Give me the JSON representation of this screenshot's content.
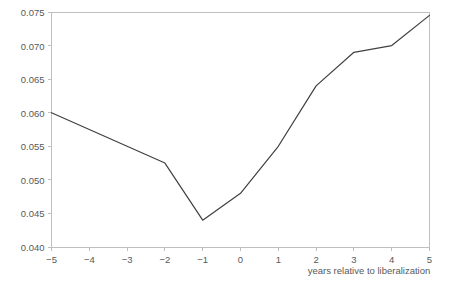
{
  "chart_data": {
    "type": "line",
    "title": "",
    "xlabel": "years relative to liberalization",
    "ylabel": "",
    "x": [
      -5,
      -4,
      -3,
      -2,
      -1,
      0,
      1,
      2,
      3,
      4,
      5
    ],
    "values": [
      0.06,
      0.0575,
      0.055,
      0.0525,
      0.044,
      0.048,
      0.055,
      0.064,
      0.069,
      0.07,
      0.0745
    ],
    "series": [
      {
        "name": "series-1",
        "values": [
          0.06,
          0.0575,
          0.055,
          0.0525,
          0.044,
          0.048,
          0.055,
          0.064,
          0.069,
          0.07,
          0.0745
        ]
      }
    ],
    "xlim": [
      -5,
      5
    ],
    "ylim": [
      0.04,
      0.075
    ],
    "x_ticks": [
      -5,
      -4,
      -3,
      -2,
      -1,
      0,
      1,
      2,
      3,
      4,
      5
    ],
    "x_tick_labels": [
      "−5",
      "−4",
      "−3",
      "−2",
      "−1",
      "0",
      "1",
      "2",
      "3",
      "4",
      "5"
    ],
    "y_ticks": [
      0.04,
      0.045,
      0.05,
      0.055,
      0.06,
      0.065,
      0.07,
      0.075
    ],
    "y_tick_labels": [
      "0.040",
      "0.045",
      "0.050",
      "0.055",
      "0.060",
      "0.065",
      "0.070",
      "0.075"
    ],
    "grid": false,
    "legend": "none",
    "line_color": "#404040",
    "axis_color": "#bfbfbf",
    "text_color": "#595959",
    "background_color": "#ffffff"
  }
}
